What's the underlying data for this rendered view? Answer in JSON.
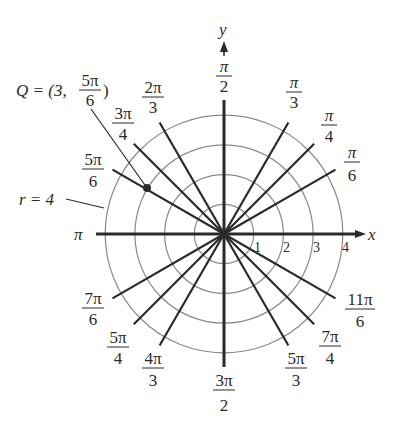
{
  "diagram": {
    "type": "polar-grid",
    "center_px": [
      224,
      234
    ],
    "unit_px": 29.7,
    "ring_count": 4,
    "ring_labels": [
      "1",
      "2",
      "3",
      "4"
    ],
    "axis_labels": {
      "x": "x",
      "y": "y",
      "pi": "π"
    },
    "colors": {
      "ring": "#8a8a8a",
      "ray": "#2a2a2a",
      "text": "#2a2a2a",
      "background": "#ffffff"
    },
    "angle_labels": [
      {
        "id": "pi-over-6",
        "num": "π",
        "den": "6"
      },
      {
        "id": "pi-over-4",
        "num": "π",
        "den": "4"
      },
      {
        "id": "pi-over-3",
        "num": "π",
        "den": "3"
      },
      {
        "id": "pi-over-2",
        "num": "π",
        "den": "2"
      },
      {
        "id": "2pi-over-3",
        "num": "2π",
        "den": "3"
      },
      {
        "id": "3pi-over-4",
        "num": "3π",
        "den": "4"
      },
      {
        "id": "5pi-over-6",
        "num": "5π",
        "den": "6"
      },
      {
        "id": "7pi-over-6",
        "num": "7π",
        "den": "6"
      },
      {
        "id": "5pi-over-4",
        "num": "5π",
        "den": "4"
      },
      {
        "id": "4pi-over-3",
        "num": "4π",
        "den": "3"
      },
      {
        "id": "3pi-over-2",
        "num": "3π",
        "den": "2"
      },
      {
        "id": "5pi-over-3",
        "num": "5π",
        "den": "3"
      },
      {
        "id": "7pi-over-4",
        "num": "7π",
        "den": "4"
      },
      {
        "id": "11pi-over-6",
        "num": "11π",
        "den": "6"
      }
    ],
    "point_Q": {
      "label_prefix": "Q = (3,",
      "label_num": "5π",
      "label_den": "6",
      "label_suffix": ")",
      "r": 3,
      "theta": "5π/6"
    },
    "circle_callout": {
      "label": "r = 4"
    }
  }
}
